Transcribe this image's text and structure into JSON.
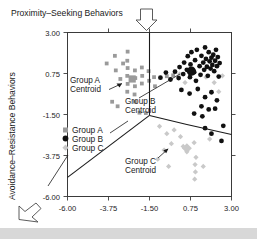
{
  "figure": {
    "title": "Proximity–Seeking Behaviors",
    "y_axis_title": "Avoidance–Resistance Behaviors",
    "arrow_top": "down-arrow-icon",
    "arrow_bottom_left": "up-left-arrow-icon"
  },
  "annotations": [
    {
      "id": "a",
      "line1": "Group A",
      "line2": "Centroid"
    },
    {
      "id": "b",
      "line1": "Group B",
      "line2": "Centroid"
    },
    {
      "id": "c",
      "line1": "Group C",
      "line2": "Centroid"
    }
  ],
  "legend": {
    "items": [
      {
        "label": "Group A",
        "marker": "square",
        "color": "#9a9a9a"
      },
      {
        "label": "Group B",
        "marker": "circle",
        "color": "#111111"
      },
      {
        "label": "Group C",
        "marker": "diamond",
        "color": "#c9c9c9"
      }
    ]
  },
  "chart_data": {
    "type": "scatter",
    "title": "Proximity–Seeking Behaviors",
    "xlabel": "Proximity–Seeking Behaviors",
    "ylabel": "Avoidance–Resistance Behaviors",
    "xlim": [
      -6.0,
      3.0
    ],
    "ylim": [
      -6.0,
      3.0
    ],
    "xticks": [
      -6.0,
      -3.75,
      -1.5,
      0.75,
      3.0
    ],
    "yticks": [
      -6.0,
      -3.75,
      -1.5,
      0.75,
      3.0
    ],
    "xtick_labels": [
      "-6.00",
      "-3.75",
      "-1.50",
      "0.75",
      "3.00"
    ],
    "ytick_labels": [
      "-6.00",
      "-3.75",
      "-1.50",
      "0.75",
      "3.00"
    ],
    "grid": false,
    "legend_position": "inner-left",
    "series": [
      {
        "name": "Group A",
        "marker": "square",
        "color": "#9a9a9a",
        "points": [
          [
            -3.85,
            1.3
          ],
          [
            -3.35,
            0.92
          ],
          [
            -3.1,
            0.45
          ],
          [
            -2.7,
            1.95
          ],
          [
            -2.72,
            1.45
          ],
          [
            -2.7,
            1.05
          ],
          [
            -2.72,
            0.62
          ],
          [
            -2.7,
            0.18
          ],
          [
            -2.72,
            -0.25
          ],
          [
            -2.3,
            0.92
          ],
          [
            -2.28,
            0.5
          ],
          [
            -2.3,
            0.05
          ],
          [
            -2.32,
            -0.4
          ],
          [
            -2.3,
            -0.8
          ],
          [
            -1.92,
            1.08
          ],
          [
            -1.9,
            0.62
          ],
          [
            -1.92,
            0.2
          ],
          [
            -1.55,
            0.88
          ],
          [
            -1.52,
            0.35
          ],
          [
            -3.55,
            -0.8
          ],
          [
            -3.25,
            -1.05
          ],
          [
            -2.05,
            -1.4
          ],
          [
            -1.7,
            -1.42
          ],
          [
            -1.25,
            0.55
          ],
          [
            -1.2,
            0.05
          ],
          [
            -3.4,
            1.72
          ],
          [
            -2.95,
            1.3
          ],
          [
            -0.55,
            0.6
          ],
          [
            -0.2,
            0.65
          ]
        ],
        "centroid": [
          -2.45,
          0.45
        ]
      },
      {
        "name": "Group B",
        "marker": "circle",
        "color": "#111111",
        "points": [
          [
            -0.9,
            0.52
          ],
          [
            -0.6,
            0.8
          ],
          [
            -0.35,
            0.42
          ],
          [
            -0.1,
            0.85
          ],
          [
            0.1,
            0.5
          ],
          [
            0.15,
            1.1
          ],
          [
            0.35,
            0.72
          ],
          [
            0.4,
            1.35
          ],
          [
            0.55,
            0.95
          ],
          [
            0.6,
            1.7
          ],
          [
            0.72,
            0.55
          ],
          [
            0.75,
            1.25
          ],
          [
            0.8,
            1.92
          ],
          [
            0.95,
            0.82
          ],
          [
            1.0,
            1.48
          ],
          [
            1.05,
            0.35
          ],
          [
            1.1,
            2.05
          ],
          [
            1.25,
            1.15
          ],
          [
            1.3,
            0.68
          ],
          [
            1.35,
            1.72
          ],
          [
            1.45,
            1.35
          ],
          [
            1.5,
            0.95
          ],
          [
            1.55,
            2.18
          ],
          [
            1.6,
            1.55
          ],
          [
            1.65,
            1.12
          ],
          [
            1.7,
            0.62
          ],
          [
            1.75,
            1.92
          ],
          [
            1.8,
            1.42
          ],
          [
            1.85,
            1.02
          ],
          [
            1.9,
            1.62
          ],
          [
            1.95,
            1.22
          ],
          [
            2.0,
            1.78
          ],
          [
            2.05,
            0.88
          ],
          [
            2.1,
            1.45
          ],
          [
            2.15,
            2.05
          ],
          [
            2.2,
            1.15
          ],
          [
            2.25,
            1.65
          ],
          [
            2.3,
            0.58
          ],
          [
            2.35,
            1.32
          ],
          [
            0.25,
            -0.15
          ],
          [
            0.7,
            -0.35
          ],
          [
            1.15,
            -0.1
          ],
          [
            1.55,
            -0.55
          ],
          [
            1.9,
            -0.28
          ],
          [
            2.2,
            -0.72
          ],
          [
            1.35,
            -1.05
          ],
          [
            1.75,
            -1.22
          ],
          [
            2.1,
            -1.18
          ],
          [
            0.95,
            -1.45
          ],
          [
            1.4,
            -1.6
          ],
          [
            1.55,
            -2.25
          ],
          [
            1.9,
            -2.55
          ],
          [
            2.55,
            -2.12
          ],
          [
            2.45,
            -2.95
          ]
        ],
        "centroid": [
          0.8,
          0.88
        ]
      },
      {
        "name": "Group C",
        "marker": "diamond",
        "color": "#c9c9c9",
        "points": [
          [
            0.15,
            0.72
          ],
          [
            0.45,
            0.25
          ],
          [
            1.6,
            0.55
          ],
          [
            2.05,
            0.25
          ],
          [
            2.5,
            0.62
          ],
          [
            2.3,
            -0.25
          ],
          [
            -0.55,
            -2.55
          ],
          [
            -0.15,
            -2.35
          ],
          [
            0.2,
            -2.72
          ],
          [
            -0.3,
            -3.1
          ],
          [
            0.35,
            -3.25
          ],
          [
            -0.95,
            -2.15
          ],
          [
            -0.7,
            -3.45
          ],
          [
            0.55,
            -3.55
          ],
          [
            0.95,
            -3.05
          ],
          [
            1.05,
            -3.85
          ],
          [
            1.0,
            -4.25
          ],
          [
            1.02,
            -4.65
          ],
          [
            0.98,
            -5.05
          ],
          [
            1.45,
            -4.35
          ],
          [
            1.8,
            -2.85
          ],
          [
            -1.05,
            -3.95
          ],
          [
            -0.45,
            -4.35
          ]
        ],
        "centroid": [
          0.55,
          -3.35
        ]
      }
    ],
    "boundaries": [
      {
        "name": "upper-vertical",
        "points": [
          [
            -1.5,
            3.0
          ],
          [
            -1.5,
            -1.55
          ]
        ]
      },
      {
        "name": "lower-left-branch",
        "points": [
          [
            -1.5,
            -1.55
          ],
          [
            -6.0,
            -4.95
          ]
        ]
      },
      {
        "name": "right-branch",
        "points": [
          [
            -1.5,
            -1.55
          ],
          [
            0.55,
            -2.05
          ],
          [
            3.0,
            -2.6
          ]
        ]
      }
    ]
  }
}
